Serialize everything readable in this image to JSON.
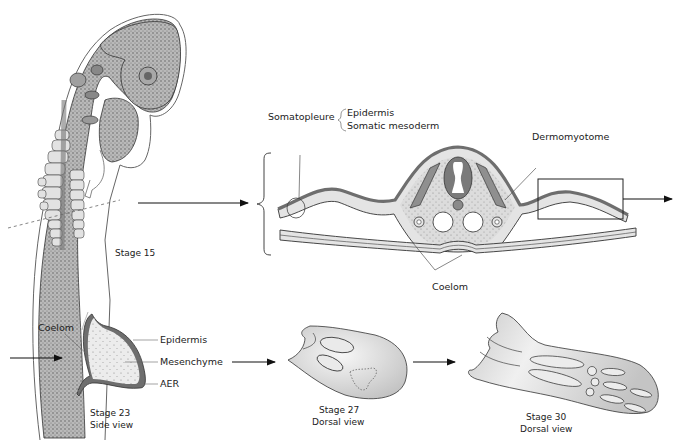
{
  "figure": {
    "stage15": {
      "caption": "Stage 15"
    },
    "cross_section": {
      "labels": {
        "somatopleure": "Somatopleure",
        "epidermis": "Epidermis",
        "somatic_mesoderm": "Somatic mesoderm",
        "dermomyotome": "Dermomyotome",
        "coelom": "Coelom"
      }
    },
    "stage23": {
      "caption_line1": "Stage 23",
      "caption_line2": "Side view",
      "labels": {
        "coelom": "Coelom",
        "epidermis": "Epidermis",
        "mesenchyme": "Mesenchyme",
        "aer": "AER"
      }
    },
    "stage27": {
      "caption_line1": "Stage 27",
      "caption_line2": "Dorsal view"
    },
    "stage30": {
      "caption_line1": "Stage 30",
      "caption_line2": "Dorsal view"
    },
    "colors": {
      "tissue_light": "#e6e6e6",
      "tissue_dark": "#7a7a7a",
      "outline": "#333333",
      "stipple": "#9a9a9a"
    }
  }
}
